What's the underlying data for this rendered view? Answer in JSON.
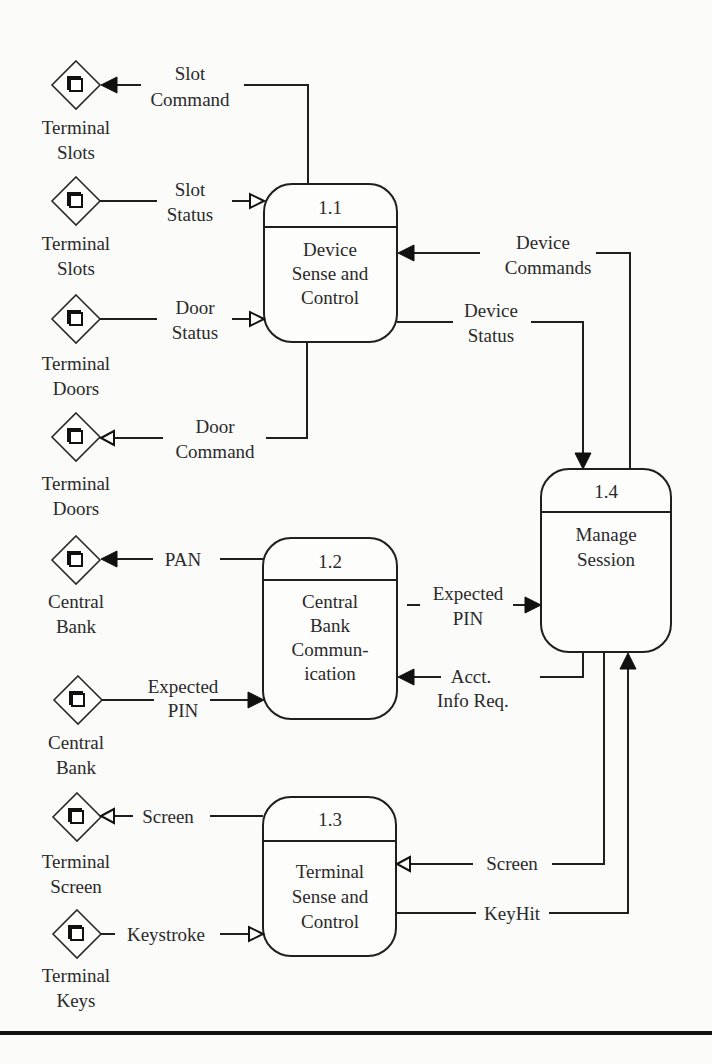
{
  "diagram": {
    "type": "data-flow-diagram",
    "processes": [
      {
        "id": "1.1",
        "lines": [
          "Device",
          "Sense and",
          "Control"
        ]
      },
      {
        "id": "1.2",
        "lines": [
          "Central",
          "Bank",
          "Commun-",
          "ication"
        ]
      },
      {
        "id": "1.3",
        "lines": [
          "Terminal",
          "Sense and",
          "Control"
        ]
      },
      {
        "id": "1.4",
        "lines": [
          "Manage",
          "Session"
        ]
      }
    ],
    "terminators": [
      {
        "lines": [
          "Terminal",
          "Slots"
        ]
      },
      {
        "lines": [
          "Terminal",
          "Slots"
        ]
      },
      {
        "lines": [
          "Terminal",
          "Doors"
        ]
      },
      {
        "lines": [
          "Terminal",
          "Doors"
        ]
      },
      {
        "lines": [
          "Central",
          "Bank"
        ]
      },
      {
        "lines": [
          "Central",
          "Bank"
        ]
      },
      {
        "lines": [
          "Terminal",
          "Screen"
        ]
      },
      {
        "lines": [
          "Terminal",
          "Keys"
        ]
      }
    ],
    "flows": [
      {
        "lines": [
          "Slot",
          "Command"
        ],
        "from": "1.1",
        "to": "Terminal Slots",
        "arrow": "filled"
      },
      {
        "lines": [
          "Slot",
          "Status"
        ],
        "from": "Terminal Slots",
        "to": "1.1",
        "arrow": "open"
      },
      {
        "lines": [
          "Door",
          "Status"
        ],
        "from": "Terminal Doors",
        "to": "1.1",
        "arrow": "open"
      },
      {
        "lines": [
          "Door",
          "Command"
        ],
        "from": "1.1",
        "to": "Terminal Doors",
        "arrow": "open"
      },
      {
        "lines": [
          "PAN"
        ],
        "from": "1.2",
        "to": "Central Bank",
        "arrow": "filled"
      },
      {
        "lines": [
          "Expected",
          "PIN"
        ],
        "from": "Central Bank",
        "to": "1.2",
        "arrow": "filled"
      },
      {
        "lines": [
          "Screen"
        ],
        "from": "1.3",
        "to": "Terminal Screen",
        "arrow": "open"
      },
      {
        "lines": [
          "Keystroke"
        ],
        "from": "Terminal Keys",
        "to": "1.3",
        "arrow": "open"
      },
      {
        "lines": [
          "Device",
          "Commands"
        ],
        "from": "1.4",
        "to": "1.1",
        "arrow": "filled"
      },
      {
        "lines": [
          "Device",
          "Status"
        ],
        "from": "1.1",
        "to": "1.4",
        "arrow": "filled"
      },
      {
        "lines": [
          "Expected",
          "PIN"
        ],
        "from": "1.2",
        "to": "1.4",
        "arrow": "filled"
      },
      {
        "lines": [
          "Acct.",
          "Info Req."
        ],
        "from": "1.4",
        "to": "1.2",
        "arrow": "filled"
      },
      {
        "lines": [
          "Screen"
        ],
        "from": "1.4",
        "to": "1.3",
        "arrow": "open"
      },
      {
        "lines": [
          "KeyHit"
        ],
        "from": "1.3",
        "to": "1.4",
        "arrow": "filled"
      }
    ]
  }
}
